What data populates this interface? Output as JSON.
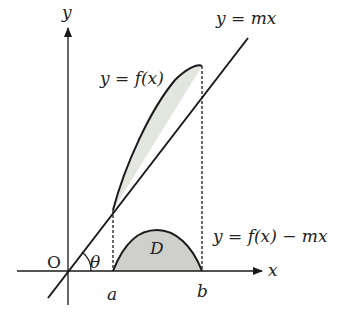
{
  "diagram": {
    "labels": {
      "y_axis": "y",
      "x_axis": "x",
      "origin": "O",
      "angle": "θ",
      "a": "a",
      "b": "b",
      "region": "D",
      "line": "y = mx",
      "curve": "y = f(x)",
      "difference": "y = f(x) − mx"
    },
    "colors": {
      "stroke": "#1a1a1a",
      "fill_upper": "#e3e5df",
      "fill_D": "#cfd0cc"
    }
  }
}
